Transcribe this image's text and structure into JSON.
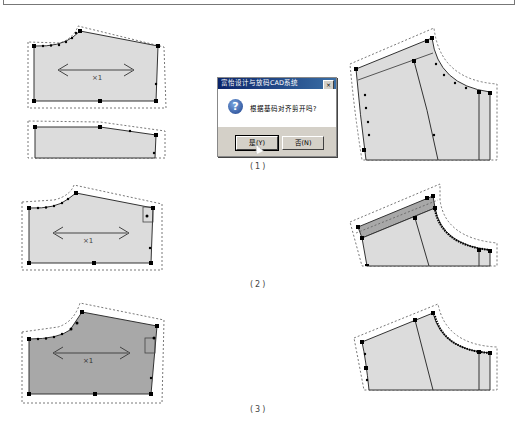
{
  "figure": {
    "captions": [
      "(1)",
      "(2)",
      "(3)"
    ],
    "colors": {
      "piece_fill": "#dcdcdc",
      "piece_fill_selected": "#a8a8a8",
      "outline": "#333333",
      "seam_allowance": "#555555",
      "point": "#000000"
    },
    "grain_label": "×1"
  },
  "dialog": {
    "title": "富怡设计与放码CAD系统",
    "close_label": "×",
    "icon": "question-icon",
    "message": "根据基码对齐剪开吗?",
    "yes_label": "是(Y)",
    "no_label": "否(N)"
  }
}
